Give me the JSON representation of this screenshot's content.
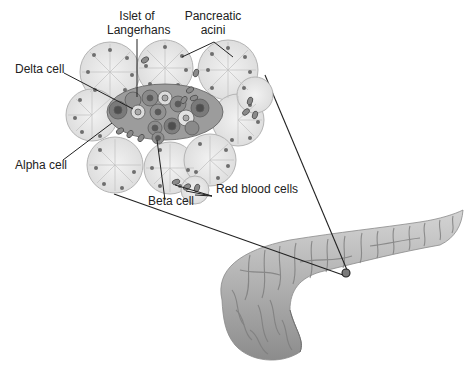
{
  "diagram": {
    "labels": {
      "islet": {
        "line1": "Islet of",
        "line2": "Langerhans"
      },
      "acini": {
        "line1": "Pancreatic",
        "line2": "acini"
      },
      "delta": "Delta cell",
      "alpha": "Alpha cell",
      "beta": "Beta cell",
      "rbc": "Red blood cells"
    },
    "colors": {
      "acinar_fill": "#e6e6e6",
      "acinar_stroke": "#b4b4b4",
      "nucleus": "#6e6e6e",
      "islet_dark": "#7a7a7a",
      "islet_mid": "#9c9c9c",
      "islet_light": "#dcdcdc",
      "rbc": "#8a8a8a",
      "pancreas": "#a8a8a8",
      "line": "#222222"
    }
  }
}
